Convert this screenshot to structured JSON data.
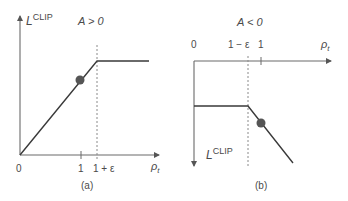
{
  "panels": [
    {
      "id": "a",
      "caption": "(a)",
      "condition": "A > 0",
      "y_axis_label": "L",
      "y_axis_label_sup": "CLIP",
      "x_axis_label": "ρ",
      "x_axis_label_sub": "t",
      "x_ticks": [
        {
          "label": "0"
        },
        {
          "label": "1"
        },
        {
          "label": "1 + ε"
        }
      ],
      "description": "Linear increase from origin up to 1 + ε, then flat (clipped); dot marks point on the rising segment near ρ=1"
    },
    {
      "id": "b",
      "caption": "(b)",
      "condition": "A < 0",
      "y_axis_label": "L",
      "y_axis_label_sup": "CLIP",
      "x_axis_label": "ρ",
      "x_axis_label_sub": "t",
      "x_ticks": [
        {
          "label": "0"
        },
        {
          "label": "1 − ε"
        },
        {
          "label": "1"
        }
      ],
      "description": "Flat (clipped) until 1 − ε, then decreasing linearly; dot marks point on the falling segment near ρ=1"
    }
  ],
  "colors": {
    "axis": "#6a6a6a",
    "line": "#3a3a3a",
    "dashed": "#8a8a8a",
    "dot": "#555555",
    "text": "#4a4a4a"
  }
}
